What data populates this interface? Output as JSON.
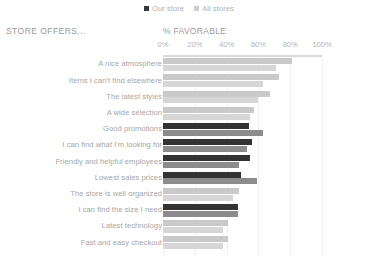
{
  "legend": {
    "items": [
      {
        "label": "Our store",
        "color": "#333333",
        "icon": "square-swatch-icon"
      },
      {
        "label": "All stores",
        "color": "#cfcfcf",
        "icon": "square-swatch-icon"
      }
    ]
  },
  "header": {
    "left_title": "STORE OFFERS...",
    "right_title": "% FAVORABLE"
  },
  "chart_data": {
    "type": "bar",
    "orientation": "horizontal",
    "title": "% FAVORABLE",
    "subtitle": "STORE OFFERS...",
    "xlabel": "",
    "ylabel": "",
    "xlim": [
      0,
      100
    ],
    "xticks": [
      0,
      20,
      40,
      60,
      80,
      100
    ],
    "xtick_labels": [
      "0%",
      "20%",
      "40%",
      "60%",
      "80%",
      "100%"
    ],
    "grid": true,
    "legend_position": "top-center",
    "value_unit": "%",
    "categories": [
      "A nice atmosphere",
      "Items I can't find elsewhere",
      "The latest styles",
      "A wide selection",
      "Good promotions",
      "I can find what I'm looking for",
      "Friendly and helpful employees",
      "Lowest sales prices",
      "The store is well organized",
      "I can find the size I need",
      "Latest technology",
      "Fast and easy checkout"
    ],
    "series": [
      {
        "name": "Our store",
        "values": [
          81,
          73,
          67,
          57,
          54,
          56,
          55,
          49,
          48,
          47,
          41,
          41
        ],
        "emphasis": [
          false,
          false,
          false,
          false,
          true,
          true,
          true,
          true,
          false,
          true,
          false,
          false
        ]
      },
      {
        "name": "All stores",
        "values": [
          71,
          63,
          60,
          55,
          63,
          53,
          48,
          59,
          44,
          47,
          38,
          38
        ],
        "emphasis": [
          false,
          false,
          false,
          false,
          true,
          true,
          true,
          true,
          false,
          true,
          false,
          false
        ]
      }
    ]
  }
}
